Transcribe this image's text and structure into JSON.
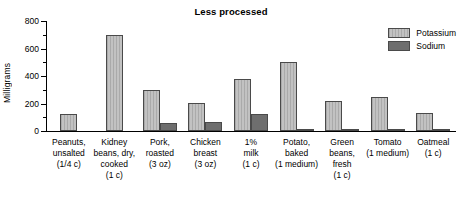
{
  "chart_data": {
    "type": "bar",
    "title": "Less processed",
    "xlabel": "",
    "ylabel": "Milligrams",
    "ylim": [
      0,
      800
    ],
    "yticks": [
      0,
      200,
      400,
      600,
      800
    ],
    "ytick_labels": [
      "0",
      "200",
      "400",
      "600",
      "800"
    ],
    "minor_ticks": [
      100,
      300,
      500,
      700
    ],
    "grid": false,
    "legend_position": "top-right",
    "categories": [
      "Peanuts,\nunsalted\n(1/4 c)",
      "Kidney\nbeans, dry,\ncooked\n(1 c)",
      "Pork,\nroasted\n(3 oz)",
      "Chicken\nbreast\n(3 oz)",
      "1%\nmilk\n(1 c)",
      "Potato,\nbaked\n(1 medium)",
      "Green\nbeans,\nfresh\n(1 c)",
      "Tomato\n(1 medium)",
      "Oatmeal\n(1 c)"
    ],
    "series": [
      {
        "name": "Potassium",
        "color": "#c2c2c2",
        "values": [
          125,
          700,
          300,
          205,
          380,
          500,
          220,
          250,
          130
        ]
      },
      {
        "name": "Sodium",
        "color": "#6e6e6e",
        "values": [
          0,
          0,
          60,
          65,
          125,
          10,
          10,
          10,
          3
        ]
      }
    ]
  }
}
